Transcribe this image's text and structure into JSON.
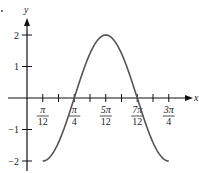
{
  "chart_data": {
    "type": "line",
    "title": "",
    "xlabel": "x",
    "ylabel": "y",
    "function": "y = -2cos(3x - π/4)",
    "x_ticks": [
      "π/12",
      "π/6",
      "π/4",
      "π/3",
      "5π/12",
      "π/2",
      "7π/12",
      "2π/3",
      "3π/4"
    ],
    "x_tick_labels": [
      {
        "num": "π",
        "den": "12",
        "value": "π/12"
      },
      {
        "num": "π",
        "den": "4",
        "value": "π/4"
      },
      {
        "num": "5π",
        "den": "12",
        "value": "5π/12"
      },
      {
        "num": "7π",
        "den": "12",
        "value": "7π/12"
      },
      {
        "num": "3π",
        "den": "4",
        "value": "3π/4"
      }
    ],
    "y_ticks": [
      2,
      1,
      -1,
      -2
    ],
    "y_tick_labels": [
      "2",
      "1",
      "−1",
      "−2"
    ],
    "ylim": [
      -2,
      2
    ],
    "xlim": [
      "π/12",
      "3π/4"
    ],
    "series": [
      {
        "name": "y = -2cos(3x - π/4)",
        "x": [
          "π/12",
          "π/4",
          "5π/12",
          "7π/12",
          "3π/4"
        ],
        "values": [
          -2,
          0,
          2,
          0,
          -2
        ]
      }
    ],
    "grid": false,
    "legend": null
  },
  "colors": {
    "axis": "#111111",
    "curve": "#555555",
    "text": "#222222"
  }
}
